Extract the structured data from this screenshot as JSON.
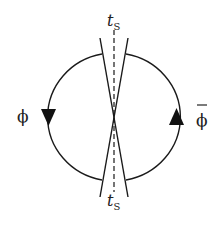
{
  "diagram": {
    "type": "feynman-loop-diagram",
    "labels": {
      "top_time": "t",
      "top_time_sub": "S",
      "bottom_time": "t",
      "bottom_time_sub": "S",
      "left_field": "ϕ",
      "right_field": "ϕ",
      "right_field_bar": true
    },
    "arrows": {
      "left": "down",
      "right": "up"
    },
    "colors": {
      "line": "#1a1a1a",
      "text": "#222222",
      "background": "#ffffff"
    }
  }
}
